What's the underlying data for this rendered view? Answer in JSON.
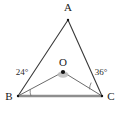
{
  "figure": {
    "type": "geometry-diagram",
    "background_color": "#ffffff",
    "shape": "triangle",
    "points": {
      "A": {
        "label": "A",
        "x": 68,
        "y": 20,
        "label_x": 68,
        "label_y": 11
      },
      "B": {
        "label": "B",
        "x": 18,
        "y": 96,
        "label_x": 9,
        "label_y": 99
      },
      "C": {
        "label": "C",
        "x": 102,
        "y": 96,
        "label_x": 110,
        "label_y": 99
      },
      "O": {
        "label": "O",
        "x": 63,
        "y": 72,
        "label_x": 63,
        "label_y": 64
      }
    },
    "angles": [
      {
        "name": "angle-at-B",
        "label": "24°",
        "value": 24,
        "unit": "degrees",
        "vertex": "B",
        "label_x": 23,
        "label_y": 72
      },
      {
        "name": "angle-at-C",
        "label": "36°",
        "value": 36,
        "unit": "degrees",
        "vertex": "C",
        "label_x": 100,
        "label_y": 72
      }
    ],
    "segments": [
      {
        "name": "side-AB",
        "from": "A",
        "to": "B",
        "style": "thin-dark"
      },
      {
        "name": "side-AC",
        "from": "A",
        "to": "C",
        "style": "thin-dark"
      },
      {
        "name": "side-BC",
        "from": "B",
        "to": "C",
        "style": "thick-gray"
      },
      {
        "name": "cevian-OB",
        "from": "O",
        "to": "B",
        "style": "thin-gray"
      },
      {
        "name": "cevian-OC",
        "from": "O",
        "to": "C",
        "style": "thin-gray"
      }
    ],
    "colors": {
      "side_stroke": "#3a3a3a",
      "base_stroke": "#8e8e8e",
      "cevian_stroke": "#6b6b6b",
      "label_text": "#1a1a1a",
      "point_fill": "#111111"
    }
  }
}
